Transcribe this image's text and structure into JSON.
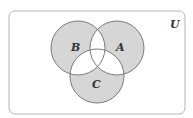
{
  "diagram": {
    "type": "venn",
    "universe_label": "U",
    "sets": [
      {
        "name": "B",
        "cx": 78,
        "cy": 48,
        "r": 27
      },
      {
        "name": "A",
        "cx": 117,
        "cy": 48,
        "r": 27
      },
      {
        "name": "C",
        "cx": 97,
        "cy": 76,
        "r": 27
      }
    ],
    "shaded_regions": [
      "B only",
      "A only",
      "C only"
    ],
    "unshaded_regions": [
      "A∩B",
      "A∩C",
      "B∩C",
      "A∩B∩C",
      "outside"
    ],
    "colors": {
      "shade": "#d6d6d6",
      "stroke": "#7a7a7a",
      "frame": "#b5b5b5",
      "background": "#ffffff"
    }
  },
  "labels": {
    "U": "U",
    "A": "A",
    "B": "B",
    "C": "C"
  }
}
